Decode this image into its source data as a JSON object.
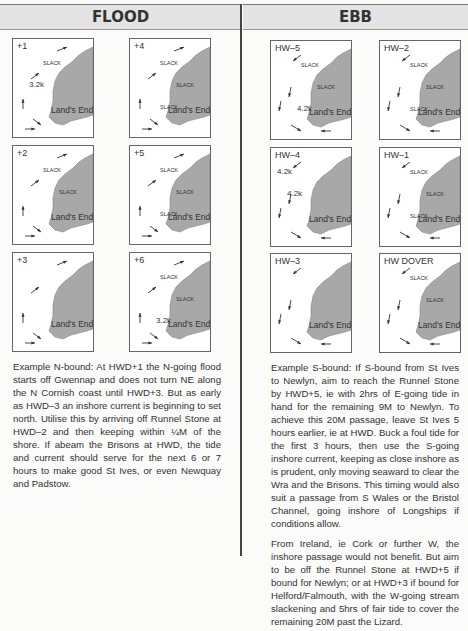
{
  "headers": {
    "flood": "FLOOD",
    "ebb": "EBB"
  },
  "flood_maps": [
    {
      "label": "+1",
      "place": "Land's End",
      "annotations": [
        "SLACK",
        "3.2k"
      ]
    },
    {
      "label": "+4",
      "place": "Land's End",
      "annotations": [
        "SLACK",
        "SLACK",
        "SLACK",
        "SLACK"
      ]
    },
    {
      "label": "+2",
      "place": "Land's End",
      "annotations": [
        "SLACK",
        "SLACK"
      ]
    },
    {
      "label": "+5",
      "place": "Land's End",
      "annotations": [
        "SLACK",
        "SLACK",
        "SLACK"
      ]
    },
    {
      "label": "+3",
      "place": "Land's End",
      "annotations": []
    },
    {
      "label": "+6",
      "place": "Land's End",
      "annotations": [
        "SLACK",
        "SLACK",
        "3.2k"
      ]
    }
  ],
  "ebb_maps": [
    {
      "label": "HW–5",
      "place": "Land's End",
      "annotations": [
        "SLACK",
        "SLACK",
        "4.2k",
        "SLACK",
        "3.2k",
        "SLACK"
      ]
    },
    {
      "label": "HW–2",
      "place": "Land's End",
      "annotations": [
        "SLACK",
        "SLACK",
        "SLACK",
        "4.2k",
        "4.2k",
        "3.2k"
      ]
    },
    {
      "label": "HW–4",
      "place": "Land's End",
      "annotations": [
        "4.2k",
        "4.2k"
      ]
    },
    {
      "label": "HW–1",
      "place": "Land's End",
      "annotations": [
        "SLACK",
        "SLACK",
        "SLACK"
      ]
    },
    {
      "label": "HW–3",
      "place": "Land's End",
      "annotations": []
    },
    {
      "label": "HW DOVER",
      "place": "Land's End",
      "annotations": [
        "SLACK",
        "SLACK"
      ]
    }
  ],
  "flood_text": "Example N-bound: At HWD+1 the N-going flood starts off Gwennap and does not turn NE along the N Cornish coast until HWD+3. But as early as HWD–3 an inshore current is beginning to set north. Utilise this by arriving off Runnel Stone at HWD–2 and then keeping within ¼M of the shore. If abeam the Brisons at HWD, the tide and current should serve for the next 6 or 7 hours to make good St Ives, or even Newquay and Padstow.",
  "ebb_text": [
    "Example S-bound: If S-bound from St Ives to Newlyn, aim to reach the Runnel Stone by HWD+5, ie with 2hrs of E-going tide in hand for the remaining 9M to Newlyn. To achieve this 20M passage, leave St Ives 5 hours earlier, ie at HWD. Buck a foul tide for the first 3 hours, then use the S-going inshore current, keeping as close inshore as is prudent, only moving seaward to clear the Wra and the Brisons. This timing would also suit a passage from S Wales or the Bristol Channel, going inshore of Longships if conditions allow.",
    "From Ireland, ie Cork or further W, the inshore passage would not benefit. But aim to be off the Runnel Stone at HWD+5 if bound for Newlyn; or at HWD+3 if bound for Helford/Falmouth, with the W-going stream slackening and 5hrs of fair tide to cover the remaining 20M past the Lizard."
  ],
  "colors": {
    "land": "#a8a8a8",
    "header_bg": "#e4e4e4",
    "divider": "#444444"
  }
}
